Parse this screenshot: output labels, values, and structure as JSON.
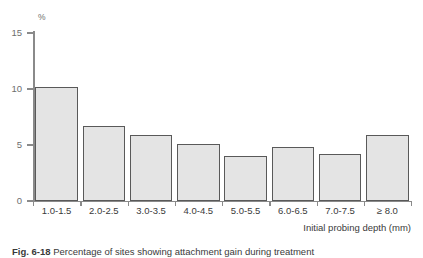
{
  "chart_data": {
    "type": "bar",
    "title": "",
    "subtitle": "",
    "xlabel": "Initial probing depth (mm)",
    "ylabel": "%",
    "unit_label": "%",
    "categories": [
      "1.0-1.5",
      "2.0-2.5",
      "3.0-3.5",
      "4.0-4.5",
      "5.0-5.5",
      "6.0-6.5",
      "7.0-7.5",
      "≥ 8.0"
    ],
    "values": [
      10.2,
      6.7,
      5.9,
      5.1,
      4.0,
      4.8,
      4.2,
      5.9
    ],
    "ylim": [
      0,
      15
    ],
    "yticks": [
      0,
      5,
      10,
      15
    ],
    "ytick_labels": [
      "0",
      "5",
      "10",
      "15"
    ],
    "grid": false,
    "legend": false,
    "legend_position": "none",
    "bar_fill_color": "#e4e4e4",
    "bar_edge_color": "#595959",
    "axis_color": "#8a8a8a",
    "text_color": "#3a3a3a"
  },
  "caption": {
    "figure_number": "Fig. 6-18",
    "text": "Percentage of sites showing attachment gain during treatment"
  }
}
